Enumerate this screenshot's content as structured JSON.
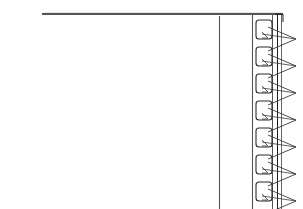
{
  "figure": {
    "kind": "technical-line-drawing",
    "title": "",
    "caption": "",
    "background_color": "#ffffff",
    "width": 303,
    "height": 209,
    "colors": {
      "primary_stroke": "#1c1c1c",
      "secondary_stroke": "#555555",
      "slot_stroke": "#2a2a2a",
      "arrow_stroke": "#3a3a3a",
      "fill": "#ffffff"
    }
  },
  "geometry": {
    "top_rule": {
      "name": "top-horizontal-rule",
      "x1": 42,
      "y1": 14,
      "x2": 283,
      "y2": 14,
      "stroke_width": 1.4
    },
    "vertical_rules": [
      {
        "name": "inner-left-vertical-rule",
        "x": 219,
        "y1": 16,
        "y2": 209,
        "stroke_width": 1.1
      },
      {
        "name": "slot-column-left-rule",
        "x": 252,
        "y1": 15,
        "y2": 209,
        "stroke_width": 1.1
      },
      {
        "name": "slot-column-right-rule",
        "x": 272,
        "y1": 15,
        "y2": 209,
        "stroke_width": 1.0
      },
      {
        "name": "outer-edge-rule-a",
        "x": 277,
        "y1": 14,
        "y2": 209,
        "stroke_width": 1.0
      },
      {
        "name": "outer-edge-rule-b",
        "x": 281,
        "y1": 14,
        "y2": 209,
        "stroke_width": 0.9
      }
    ],
    "corner_arc": {
      "name": "top-right-corner",
      "x": 283,
      "y": 14
    }
  },
  "slots": {
    "count": 8,
    "first_top_y": 20,
    "pitch_y": 27,
    "left_x": 256,
    "width": 16,
    "height": 19,
    "corner_radius": 3,
    "items": [
      {
        "index": 1,
        "top_y": 20
      },
      {
        "index": 2,
        "top_y": 47
      },
      {
        "index": 3,
        "top_y": 74
      },
      {
        "index": 4,
        "top_y": 101
      },
      {
        "index": 5,
        "top_y": 128
      },
      {
        "index": 6,
        "top_y": 155
      },
      {
        "index": 7,
        "top_y": 182
      },
      {
        "index": 8,
        "top_y": 209
      }
    ]
  },
  "arrows": {
    "count": 7,
    "description": "right-pointing triangular pointers adjacent to each slot",
    "first_apex_y": 39,
    "pitch_y": 27,
    "base_x": 268,
    "apex_x": 296,
    "half_height": 12,
    "items": [
      {
        "index": 1,
        "apex_y": 39
      },
      {
        "index": 2,
        "apex_y": 66
      },
      {
        "index": 3,
        "apex_y": 93
      },
      {
        "index": 4,
        "apex_y": 120
      },
      {
        "index": 5,
        "apex_y": 147
      },
      {
        "index": 6,
        "apex_y": 174
      },
      {
        "index": 7,
        "apex_y": 201
      }
    ]
  },
  "leaders": {
    "count": 7,
    "description": "diagonal leader lines connecting each slot corner to the arrow apex",
    "items": [
      {
        "index": 1,
        "x1": 262,
        "y1": 34,
        "x2": 296,
        "y2": 39
      },
      {
        "index": 2,
        "x1": 262,
        "y1": 61,
        "x2": 296,
        "y2": 66
      },
      {
        "index": 3,
        "x1": 262,
        "y1": 88,
        "x2": 296,
        "y2": 93
      },
      {
        "index": 4,
        "x1": 262,
        "y1": 115,
        "x2": 296,
        "y2": 120
      },
      {
        "index": 5,
        "x1": 262,
        "y1": 142,
        "x2": 296,
        "y2": 147
      },
      {
        "index": 6,
        "x1": 262,
        "y1": 169,
        "x2": 296,
        "y2": 174
      },
      {
        "index": 7,
        "x1": 262,
        "y1": 196,
        "x2": 296,
        "y2": 201
      }
    ]
  },
  "labels": {
    "visible_text": []
  }
}
